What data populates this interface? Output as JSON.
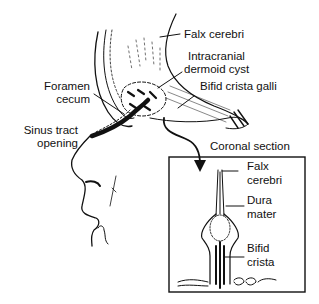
{
  "diagram": {
    "type": "anatomical-illustration",
    "main_labels": {
      "falx_cerebri": "Falx cerebri",
      "intracranial_cyst_line1": "Intracranial",
      "intracranial_cyst_line2": "dermoid cyst",
      "bifid_crista_galli": "Bifid crista galli",
      "foramen_line1": "Foramen",
      "foramen_line2": "cecum",
      "sinus_line1": "Sinus tract",
      "sinus_line2": "opening"
    },
    "inset": {
      "title": "Coronal section",
      "labels": {
        "falx_line1": "Falx",
        "falx_line2": "cerebri",
        "dura_line1": "Dura",
        "dura_line2": "mater",
        "crista_line1": "Bifid",
        "crista_line2": "crista"
      }
    },
    "colors": {
      "ink": "#111111",
      "background": "#ffffff"
    }
  }
}
